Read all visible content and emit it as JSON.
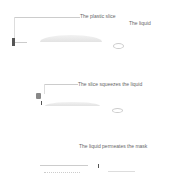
{
  "panels": [
    {
      "labels": {
        "slice": "The plastic slice",
        "liquid": "The liquid"
      }
    },
    {
      "labels": {
        "caption": "The slice squeezes the liquid"
      }
    },
    {
      "labels": {
        "caption": "The liquid permeates the mask"
      }
    }
  ],
  "colors": {
    "slice": "#555555",
    "mask": "#e3e3e3",
    "text": "#666666"
  }
}
